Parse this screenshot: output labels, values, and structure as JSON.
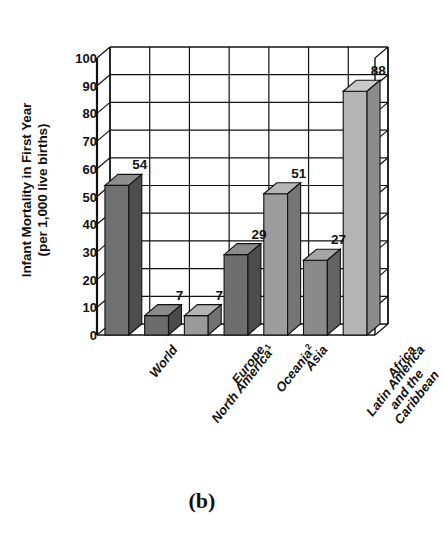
{
  "figure": {
    "caption": "(b)",
    "background_color": "#ffffff",
    "ink_color": "#111111"
  },
  "chart_data": {
    "type": "bar",
    "title": "",
    "subtitle": "",
    "xlabel": "",
    "ylabel": "Infant Mortality in First Year (per 1,000 live births)",
    "ylabel_line1": "Infant Mortality in First Year",
    "ylabel_line2": "(per 1,000 live births)",
    "categories": [
      "World",
      "North America¹",
      "Europe",
      "Oceania²",
      "Asia",
      "Latin America and the Caribbean",
      "Africa"
    ],
    "values": [
      54,
      7,
      7,
      29,
      51,
      27,
      88
    ],
    "value_labels": [
      "54",
      "7",
      "7",
      "29",
      "51",
      "27",
      "88"
    ],
    "ylim": [
      0,
      100
    ],
    "ytick_step": 10,
    "yticks": [
      "100",
      "90",
      "80",
      "70",
      "60",
      "50",
      "40",
      "30",
      "20",
      "10",
      "0"
    ],
    "grid": true,
    "legend": "none",
    "style": "3d-bar",
    "bar_colors": [
      "#717171",
      "#6c6c6c",
      "#9a9a9a",
      "#6e6e6e",
      "#9d9d9d",
      "#8a8a8a",
      "#b4b4b4"
    ],
    "bar_top_colors": [
      "#8d8d8d",
      "#8a8a8a",
      "#b4b4b4",
      "#8b8b8b",
      "#b6b6b6",
      "#a5a5a5",
      "#c9c9c9"
    ],
    "bar_side_colors": [
      "#4d4d4d",
      "#4a4a4a",
      "#727272",
      "#4c4c4c",
      "#757575",
      "#636363",
      "#8c8c8c"
    ]
  },
  "category_labels": [
    {
      "text": "World",
      "sup": ""
    },
    {
      "text": "North America",
      "sup": "1"
    },
    {
      "text": "Europe",
      "sup": ""
    },
    {
      "text": "Oceania",
      "sup": "2"
    },
    {
      "text": "Asia",
      "sup": ""
    },
    {
      "text": "Latin America|and the|Caribbean",
      "sup": ""
    },
    {
      "text": "Africa",
      "sup": ""
    }
  ]
}
